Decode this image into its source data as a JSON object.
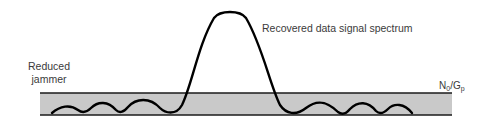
{
  "diagram": {
    "title": "",
    "labels": {
      "reduced_jammer_line1": "Reduced",
      "reduced_jammer_line2": "jammer",
      "recovered_signal": "Recovered data signal spectrum",
      "noise_level_main_N": "N",
      "noise_level_sub_0": "0",
      "noise_level_slash_G": "/G",
      "noise_level_sub_p": "p"
    },
    "band": {
      "x_left": 40,
      "x_right": 452,
      "y_top": 93,
      "y_bottom": 115,
      "fill_color": "#c9c9c9",
      "line_color": "#1a1a1a"
    },
    "signal_curve": {
      "color": "#000000",
      "peak_x": 230,
      "peak_y": 12,
      "description": "sinc-like spectrum: tall main lobe centered ~x=230 with decaying side lobes inside the jammer band"
    }
  }
}
